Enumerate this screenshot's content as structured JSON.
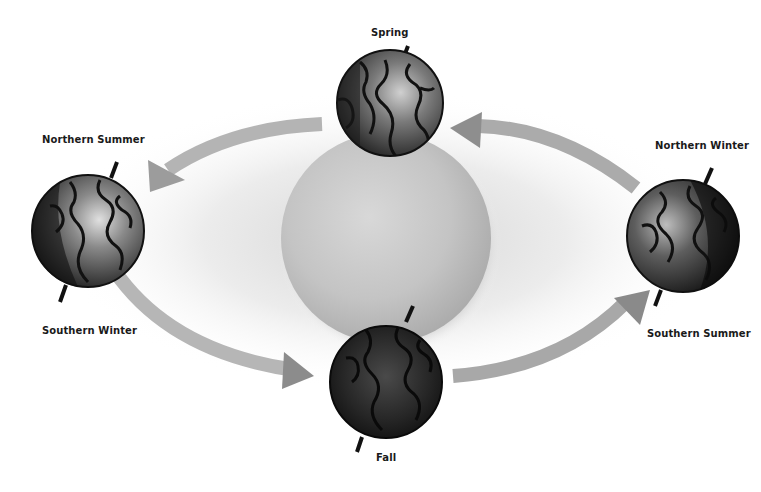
{
  "diagram": {
    "type": "earth-orbit-seasons",
    "sun": {
      "label": ""
    },
    "labels": {
      "spring": "Spring",
      "fall": "Fall",
      "northern_summer": "Northern Summer",
      "southern_winter": "Southern Winter",
      "northern_winter": "Northern Winter",
      "southern_summer": "Southern Summer"
    },
    "positions": [
      {
        "name": "spring",
        "label_keys": [
          "spring"
        ]
      },
      {
        "name": "summer-solstice-north",
        "label_keys": [
          "northern_summer",
          "southern_winter"
        ]
      },
      {
        "name": "fall",
        "label_keys": [
          "fall"
        ]
      },
      {
        "name": "winter-solstice-north",
        "label_keys": [
          "northern_winter",
          "southern_summer"
        ]
      }
    ],
    "orbit_direction": "counter-clockwise",
    "colors": {
      "background": "#ffffff",
      "sun": "#c8c8c8",
      "arrow": "#a8a8a8",
      "globe_dark": "#1c1c1c",
      "globe_light": "#9a9a9a",
      "text": "#1a1a1a"
    }
  }
}
